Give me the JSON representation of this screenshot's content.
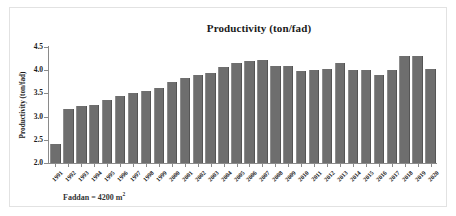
{
  "figure": {
    "title": "Productivity (ton/fad)",
    "ylabel": "Productivity  (ton/fad)",
    "footnote_text": "Faddan = 4200 m",
    "footnote_exponent": "2",
    "bar_color": "#6e6e6e",
    "axis_color": "#8a8a8a",
    "frame_color": "#e2e2e2",
    "background": "#ffffff"
  },
  "chart_data": {
    "type": "bar",
    "title": "Productivity (ton/fad)",
    "xlabel": "",
    "ylabel": "Productivity (ton/fad)",
    "ylim": [
      2.0,
      4.5
    ],
    "yticks": [
      2.0,
      2.5,
      3.0,
      3.5,
      4.0,
      4.5
    ],
    "ytick_labels": [
      "2.0",
      "2.5",
      "3.0",
      "3.5",
      "4.0",
      "4.5"
    ],
    "grid": false,
    "legend": null,
    "categories": [
      "1991",
      "1992",
      "1993",
      "1994",
      "1995",
      "1996",
      "1997",
      "1998",
      "1999",
      "2000",
      "2001",
      "2002",
      "2003",
      "2004",
      "2005",
      "2006",
      "2007",
      "2008",
      "2009",
      "2010",
      "2011",
      "2012",
      "2013",
      "2014",
      "2015",
      "2016",
      "2017",
      "2018",
      "2019",
      "2020"
    ],
    "values": [
      2.41,
      3.17,
      3.22,
      3.25,
      3.35,
      3.44,
      3.5,
      3.56,
      3.62,
      3.75,
      3.83,
      3.9,
      3.95,
      4.08,
      4.15,
      4.19,
      4.23,
      4.1,
      4.09,
      3.98,
      4.0,
      4.02,
      4.15,
      4.01,
      4.01,
      3.9,
      4.01,
      4.3,
      4.3,
      4.03
    ],
    "units": "ton/fad"
  }
}
